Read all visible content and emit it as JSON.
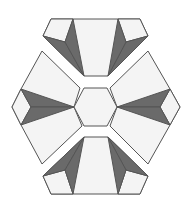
{
  "title": "Hexagonal star block pattern",
  "colors": {
    "background": "#ffffff",
    "light": "#f4f4f4",
    "dark": "#6a6a6a",
    "outline": "#555555"
  },
  "pieces": [
    {
      "name": "top-piece",
      "polys": [
        {
          "kind": "light",
          "points": "51,19 140,19 148,36 108,76 84,76 43,36"
        },
        {
          "kind": "light",
          "points": "51,19 73,19 65,42 43,36"
        },
        {
          "kind": "dark",
          "points": "43,36 65,42 84,76"
        },
        {
          "kind": "dark",
          "points": "73,19 65,42 84,76"
        },
        {
          "kind": "light",
          "points": "118,19 140,19 148,36 126,42"
        },
        {
          "kind": "dark",
          "points": "148,36 126,42 108,76"
        },
        {
          "kind": "dark",
          "points": "118,19 126,42 108,76"
        }
      ]
    },
    {
      "name": "bottom-piece",
      "polys": [
        {
          "kind": "light",
          "points": "84,137 108,137 148,176 140,194 51,194 43,176"
        },
        {
          "kind": "light",
          "points": "43,176 65,170 73,194 51,194"
        },
        {
          "kind": "dark",
          "points": "84,137 65,170 43,176"
        },
        {
          "kind": "dark",
          "points": "84,137 65,170 73,194"
        },
        {
          "kind": "light",
          "points": "148,176 126,170 118,194 140,194"
        },
        {
          "kind": "dark",
          "points": "108,137 126,170 148,176"
        },
        {
          "kind": "dark",
          "points": "108,137 126,170 118,194"
        }
      ]
    },
    {
      "name": "left-piece",
      "polys": [
        {
          "kind": "light",
          "points": "42,51 80,88 74,107 82,126 42,164 21,125 12,107 21,89"
        },
        {
          "kind": "light",
          "points": "21,89 31,107 21,125 12,107"
        },
        {
          "kind": "dark",
          "points": "21,89 31,107 74,107"
        },
        {
          "kind": "dark",
          "points": "21,125 31,107 74,107"
        }
      ]
    },
    {
      "name": "right-piece",
      "polys": [
        {
          "kind": "light",
          "points": "148,51 170,89 180,107 170,125 148,164 110,126 117,107 110,88"
        },
        {
          "kind": "light",
          "points": "170,89 180,107 170,125 160,107"
        },
        {
          "kind": "dark",
          "points": "170,89 160,107 117,107"
        },
        {
          "kind": "dark",
          "points": "170,125 160,107 117,107"
        }
      ]
    },
    {
      "name": "center-hexagon",
      "polys": [
        {
          "kind": "light",
          "points": "84,88 107,88 117,107 107,126 84,126 74,107"
        }
      ]
    }
  ]
}
